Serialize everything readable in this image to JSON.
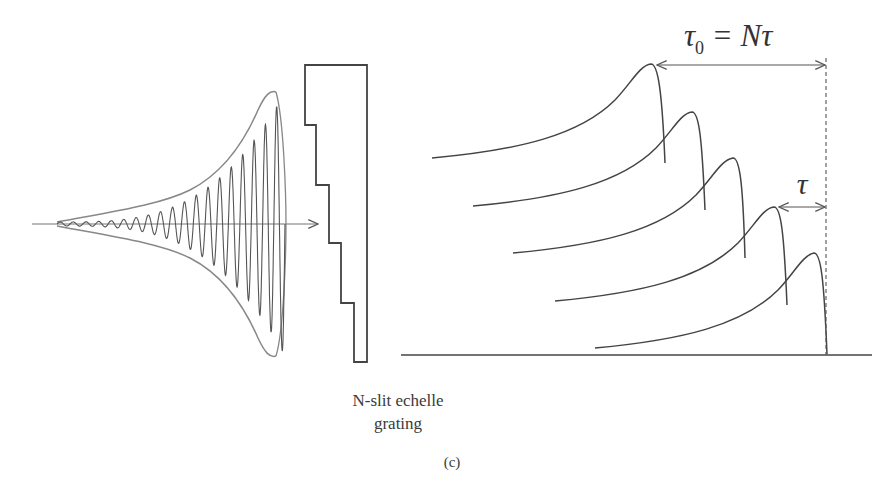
{
  "figure": {
    "panel_label": "(c)",
    "grating_label_line1": "N-slit echelle",
    "grating_label_line2": "grating",
    "annotation_total_delay": {
      "symbol": "τ",
      "subscript": "0",
      "rhs": " = Nτ"
    },
    "annotation_step_delay": "τ",
    "pulse_count": 5,
    "colors": {
      "stroke": "#555555",
      "wave": "#6a6a6a",
      "background": "#ffffff"
    }
  }
}
